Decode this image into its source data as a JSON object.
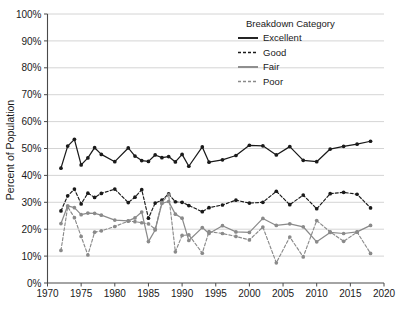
{
  "chart_data": {
    "type": "line",
    "title": "",
    "xlabel": "",
    "ylabel": "Percent of Population",
    "xlim": [
      1970,
      2020
    ],
    "ylim": [
      0,
      100
    ],
    "xticks": [
      1970,
      1975,
      1980,
      1985,
      1990,
      1995,
      2000,
      2005,
      2010,
      2015,
      2020
    ],
    "yticks": [
      0,
      10,
      20,
      30,
      40,
      50,
      60,
      70,
      80,
      90,
      100
    ],
    "ytick_labels": [
      "0%",
      "10%",
      "20%",
      "30%",
      "40%",
      "50%",
      "60%",
      "70%",
      "80%",
      "90%",
      "100%"
    ],
    "xtick_labels": [
      "1970",
      "1975",
      "1980",
      "1985",
      "1990",
      "1995",
      "2000",
      "2005",
      "2010",
      "2015",
      "2020"
    ],
    "grid": "horizontal",
    "legend_title": "Breakdown Category",
    "legend_position": "top-right",
    "series": [
      {
        "name": "Excellent",
        "color": "#1a1a1a",
        "dash": "solid",
        "marker": "circle",
        "x": [
          1972,
          1973,
          1974,
          1975,
          1976,
          1977,
          1978,
          1980,
          1982,
          1983,
          1984,
          1985,
          1986,
          1987,
          1988,
          1989,
          1990,
          1991,
          1993,
          1994,
          1996,
          1998,
          2000,
          2002,
          2004,
          2006,
          2008,
          2010,
          2012,
          2014,
          2016,
          2018
        ],
        "values": [
          42.7,
          50.9,
          53.4,
          43.9,
          46.5,
          50.3,
          47.8,
          45.1,
          50.2,
          47.2,
          45.5,
          45.2,
          47.6,
          46.6,
          47.0,
          45.0,
          47.8,
          43.4,
          50.6,
          44.9,
          45.8,
          47.4,
          51.2,
          51.0,
          47.6,
          50.7,
          45.6,
          45.1,
          49.8,
          50.8,
          51.6,
          52.7
        ]
      },
      {
        "name": "Good",
        "color": "#1a1a1a",
        "dash": "dashed",
        "marker": "circle",
        "x": [
          1972,
          1973,
          1974,
          1975,
          1976,
          1977,
          1978,
          1980,
          1982,
          1983,
          1984,
          1985,
          1986,
          1987,
          1988,
          1989,
          1990,
          1991,
          1993,
          1994,
          1996,
          1998,
          2000,
          2002,
          2004,
          2006,
          2008,
          2010,
          2012,
          2014,
          2016,
          2018
        ],
        "values": [
          26.8,
          32.4,
          34.9,
          29.4,
          33.4,
          31.8,
          33.3,
          34.9,
          29.9,
          31.9,
          34.7,
          24.1,
          29.7,
          30.8,
          33.1,
          30.2,
          30.0,
          28.8,
          26.5,
          28.0,
          29.0,
          30.8,
          29.7,
          30.0,
          34.1,
          29.1,
          32.7,
          27.6,
          33.2,
          33.7,
          33.0,
          27.9
        ]
      },
      {
        "name": "Fair",
        "color": "#8a8a8a",
        "dash": "solid",
        "marker": "circle",
        "x": [
          1972,
          1973,
          1974,
          1975,
          1976,
          1977,
          1978,
          1980,
          1982,
          1983,
          1984,
          1985,
          1986,
          1987,
          1988,
          1989,
          1990,
          1991,
          1993,
          1994,
          1996,
          1998,
          2000,
          2002,
          2004,
          2006,
          2008,
          2010,
          2012,
          2014,
          2016,
          2018
        ],
        "values": [
          22.1,
          28.7,
          28.0,
          25.4,
          26.0,
          25.9,
          25.2,
          23.4,
          23.1,
          24.2,
          26.4,
          15.4,
          19.7,
          29.6,
          30.3,
          25.6,
          24.1,
          15.8,
          20.6,
          18.4,
          21.3,
          19.0,
          18.8,
          24.0,
          21.4,
          22.0,
          20.9,
          15.3,
          18.8,
          18.4,
          19.0,
          21.4
        ]
      },
      {
        "name": "Poor",
        "color": "#8a8a8a",
        "dash": "dashed",
        "marker": "circle",
        "x": [
          1972,
          1973,
          1974,
          1975,
          1976,
          1977,
          1978,
          1980,
          1982,
          1983,
          1984,
          1985,
          1986,
          1987,
          1988,
          1989,
          1990,
          1991,
          1993,
          1994,
          1996,
          1998,
          2000,
          2002,
          2004,
          2006,
          2008,
          2010,
          2012,
          2014,
          2016,
          2018
        ],
        "values": [
          12.1,
          28.3,
          24.3,
          17.3,
          10.4,
          18.9,
          19.4,
          21.0,
          23.0,
          22.8,
          22.4,
          22.0,
          20.0,
          30.0,
          32.8,
          11.6,
          17.7,
          17.9,
          11.1,
          19.1,
          18.4,
          17.3,
          16.0,
          20.8,
          7.5,
          17.1,
          9.7,
          23.2,
          19.0,
          15.5,
          18.9,
          11.0
        ]
      }
    ]
  },
  "legend": {
    "title": "Breakdown Category",
    "entries": [
      {
        "label": "Excellent",
        "color": "#1a1a1a",
        "dash": "solid"
      },
      {
        "label": "Good",
        "color": "#1a1a1a",
        "dash": "dashed"
      },
      {
        "label": "Fair",
        "color": "#8a8a8a",
        "dash": "solid"
      },
      {
        "label": "Poor",
        "color": "#8a8a8a",
        "dash": "dashed"
      }
    ]
  },
  "axes": {
    "y_title": "Percent of Population"
  }
}
